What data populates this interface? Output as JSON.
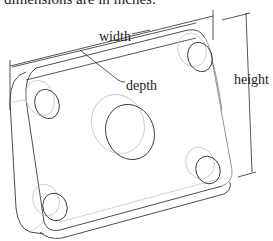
{
  "caption": {
    "text": "dimensions are in inches."
  },
  "drawing": {
    "subject": "isometric plate with four corner holes and one center hole",
    "labels": {
      "width": "width",
      "depth": "depth",
      "height": "height"
    },
    "colors": {
      "line_dark": "#3a3a3a",
      "line_light": "#c4c4c4",
      "background": "#ffffff"
    }
  }
}
